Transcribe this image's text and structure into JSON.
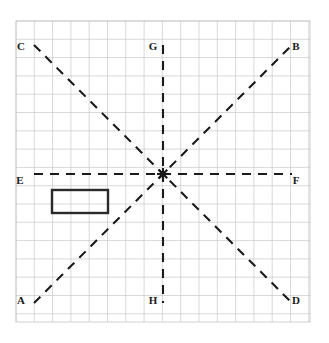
{
  "figure": {
    "canvas": {
      "width": 329,
      "height": 343,
      "background": "#ffffff"
    },
    "grid": {
      "x0": 16,
      "y0": 21,
      "x1": 310,
      "y1": 322,
      "cell_size": 18.3,
      "columns": 16,
      "rows": 16,
      "line_color": "#c9c9c9",
      "border_color": "#bdbdbd",
      "line_width": 0.7
    },
    "center_point": {
      "x": 163,
      "y": 174,
      "marker": "asterisk-node"
    },
    "stroke": {
      "line_color": "#1a1a1a",
      "line_width": 2.1,
      "dash_pattern": "9 7",
      "rect_color": "#2a2a2a",
      "rect_width": 2.4
    },
    "lines": [
      {
        "id": "AB",
        "name": "line-ab",
        "orientation": "diagonal-up-right",
        "x1": 34,
        "y1": 303,
        "x2": 292,
        "y2": 45
      },
      {
        "id": "CD",
        "name": "line-cd",
        "orientation": "diagonal-down-right",
        "x1": 34,
        "y1": 45,
        "x2": 292,
        "y2": 303
      },
      {
        "id": "EF",
        "name": "line-ef",
        "orientation": "horizontal",
        "x1": 34,
        "y1": 174,
        "x2": 292,
        "y2": 174
      },
      {
        "id": "GH",
        "name": "line-gh",
        "orientation": "vertical",
        "x1": 163,
        "y1": 45,
        "x2": 163,
        "y2": 303
      }
    ],
    "labels": [
      {
        "text": "A",
        "x": 21,
        "y": 301,
        "name": "point-label-a"
      },
      {
        "text": "B",
        "x": 296,
        "y": 47,
        "name": "point-label-b"
      },
      {
        "text": "C",
        "x": 21,
        "y": 47,
        "name": "point-label-c"
      },
      {
        "text": "D",
        "x": 296,
        "y": 301,
        "name": "point-label-d"
      },
      {
        "text": "E",
        "x": 20,
        "y": 181,
        "name": "point-label-e"
      },
      {
        "text": "F",
        "x": 296,
        "y": 181,
        "name": "point-label-f"
      },
      {
        "text": "G",
        "x": 153,
        "y": 47,
        "name": "point-label-g"
      },
      {
        "text": "H",
        "x": 153,
        "y": 301,
        "name": "point-label-h"
      }
    ],
    "rectangle": {
      "name": "shape-rectangle",
      "x": 52,
      "y": 190,
      "width": 56,
      "height": 23,
      "fill": "none",
      "stroke": "#2a2a2a"
    }
  }
}
